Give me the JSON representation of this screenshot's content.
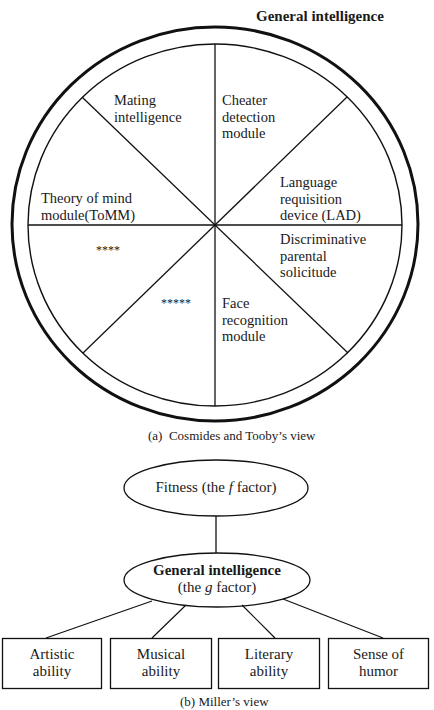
{
  "figure_a": {
    "title": "General intelligence",
    "caption": "(a)  Cosmides and Tooby’s view",
    "segments": [
      {
        "id": "mating",
        "label": "Mating\nintelligence"
      },
      {
        "id": "cheater",
        "label": "Cheater\ndetection\nmodule"
      },
      {
        "id": "language",
        "label": "Language\nrequisition\ndevice (LAD)"
      },
      {
        "id": "parental",
        "label": "Discriminative\nparental\nsolicitude"
      },
      {
        "id": "face",
        "label": "Face\nrecognition\nmodule"
      },
      {
        "id": "unknown5",
        "label": "*****"
      },
      {
        "id": "unknown4",
        "label": "****"
      },
      {
        "id": "tomm",
        "label": "Theory of mind\nmodule(ToMM)"
      }
    ]
  },
  "figure_b": {
    "top_node": {
      "prefix": "Fitness (the ",
      "italic": "f",
      "suffix": " factor)"
    },
    "middle_node": {
      "line1": "General intelligence",
      "line2_prefix": "(the ",
      "line2_italic": "g",
      "line2_suffix": " factor)"
    },
    "boxes": [
      {
        "label": "Artistic\nability"
      },
      {
        "label": "Musical\nability"
      },
      {
        "label": "Literary\nability"
      },
      {
        "label": "Sense of\nhumor"
      }
    ],
    "caption": "(b) Miller’s view"
  }
}
